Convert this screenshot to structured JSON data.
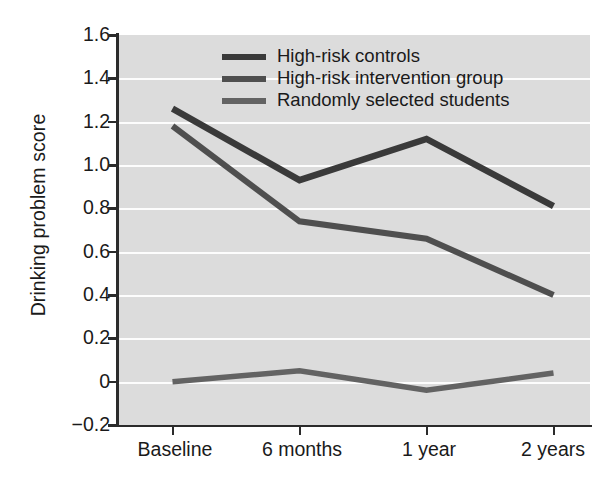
{
  "chart_data": {
    "type": "line",
    "title": "",
    "subtitle": "",
    "xlabel": "",
    "ylabel": "Drinking problem score",
    "categories": [
      "Baseline",
      "6 months",
      "1 year",
      "2 years"
    ],
    "ylim": [
      -0.2,
      1.6
    ],
    "yticks": [
      -0.2,
      0,
      0.2,
      0.4,
      0.6,
      0.8,
      1.0,
      1.2,
      1.4,
      1.6
    ],
    "ytick_labels": [
      "−0.2",
      "0",
      "0.2",
      "0.4",
      "0.6",
      "0.8",
      "1.0",
      "1.2",
      "1.4",
      "1.6"
    ],
    "grid": true,
    "grid_color": "#fdfdfd",
    "plot_background": "#dcdcdc",
    "legend_position": "top-center",
    "series": [
      {
        "name": "High-risk controls",
        "values": [
          1.26,
          0.93,
          1.12,
          0.81
        ],
        "color": "#3a3a3a"
      },
      {
        "name": "High-risk intervention group",
        "values": [
          1.18,
          0.74,
          0.66,
          0.4
        ],
        "color": "#4f4f4f"
      },
      {
        "name": "Randomly selected students",
        "values": [
          0.0,
          0.05,
          -0.04,
          0.04
        ],
        "color": "#636363"
      }
    ]
  },
  "axis": {
    "y_title": "Drinking problem score",
    "ytick_0": "1.6",
    "ytick_1": "1.4",
    "ytick_2": "1.2",
    "ytick_3": "1.0",
    "ytick_4": "0.8",
    "ytick_5": "0.6",
    "ytick_6": "0.4",
    "ytick_7": "0.2",
    "ytick_8": "0",
    "ytick_9": "−0.2",
    "xtick_0": "Baseline",
    "xtick_1": "6 months",
    "xtick_2": "1 year",
    "xtick_3": "2 years"
  },
  "legend": {
    "item_0": "High-risk controls",
    "item_1": "High-risk intervention group",
    "item_2": "Randomly selected students"
  }
}
